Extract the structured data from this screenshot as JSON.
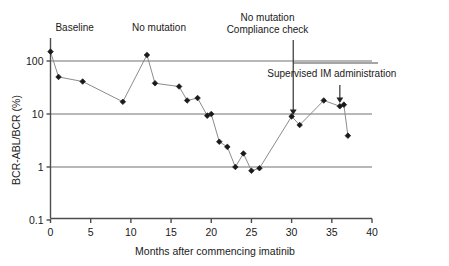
{
  "chart_data": {
    "type": "line",
    "title": "",
    "subtitle": "",
    "xlabel": "Months after commencing imatinib",
    "ylabel": "BCR-ABL/BCR (%)",
    "xlim": [
      0,
      40
    ],
    "ylim": [
      0.1,
      300
    ],
    "yscale": "log",
    "grid": "horizontal-major",
    "legend": "none",
    "xticks": [
      "0",
      "5",
      "10",
      "15",
      "20",
      "25",
      "30",
      "35",
      "40"
    ],
    "xtick_values": [
      0,
      5,
      10,
      15,
      20,
      25,
      30,
      35,
      40
    ],
    "yticks": [
      "100",
      "10",
      "1",
      "0.1"
    ],
    "ytick_values": [
      100,
      10,
      1,
      0.1
    ],
    "series": [
      {
        "name": "BCR-ABL/BCR transcript level",
        "marker": "diamond",
        "color": "#1a1a1a",
        "line_color": "#8c8c8c",
        "x": [
          0,
          1,
          4,
          9,
          12,
          13,
          16,
          17,
          18.3,
          19.5,
          20,
          21,
          22,
          23,
          24,
          25,
          26,
          30,
          31,
          34,
          36,
          36.5,
          37
        ],
        "y": [
          150,
          50,
          41,
          17,
          130,
          38,
          33,
          18,
          20,
          9.3,
          10,
          3.0,
          2.4,
          1.0,
          1.8,
          0.85,
          0.95,
          9.0,
          6.2,
          18,
          14,
          15,
          3.9
        ]
      }
    ],
    "annotations": [
      {
        "name": "baseline",
        "text": "Baseline",
        "x": 3.0,
        "y_px": 31,
        "align": "center"
      },
      {
        "name": "no-mutation",
        "text": "No mutation",
        "x": 13.5,
        "y_px": 31,
        "align": "center"
      },
      {
        "name": "no-mutation-compliance-line1",
        "text": "No mutation",
        "x": 27.0,
        "y_px": 21,
        "align": "center"
      },
      {
        "name": "no-mutation-compliance-line2",
        "text": "Compliance check",
        "x": 27.0,
        "y_px": 33,
        "align": "center"
      },
      {
        "name": "supervised-im",
        "text": "Supervised IM administration",
        "x": 35.0,
        "y_px": 77,
        "align": "center"
      }
    ],
    "arrows": [
      {
        "name": "compliance-check-arrow",
        "x": 30.2,
        "from_y_px": 40,
        "to_y_px": 115
      },
      {
        "name": "supervised-im-arrow",
        "x": 36.0,
        "from_y_px": 85,
        "to_y_px": 103
      }
    ],
    "bracket": {
      "name": "supervised-im-bracket",
      "x_start": 30.2,
      "x_end": 40.0,
      "y_px": 63
    }
  },
  "colors": {
    "axis": "#4d4d4d",
    "gridline": "#737373",
    "marker": "#1a1a1a",
    "dataline": "#8c8c8c",
    "text": "#1a1a1a",
    "background": "#ffffff"
  }
}
